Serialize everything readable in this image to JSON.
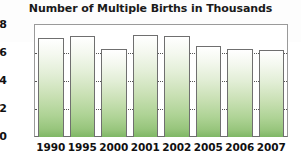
{
  "chart_data": {
    "type": "bar",
    "title": "Number of Multiple Births in Thousands",
    "xlabel": "",
    "ylabel": "",
    "categories": [
      "1990",
      "1995",
      "2000",
      "2001",
      "2002",
      "2005",
      "2006",
      "2007"
    ],
    "values": [
      3.0,
      4.8,
      7.1,
      7.3,
      7.2,
      6.5,
      6.3,
      6.2
    ],
    "ylim": [
      0,
      8
    ],
    "yticks": [
      0,
      2,
      4,
      6,
      8
    ],
    "ytick_labels": [
      "0",
      "2",
      "4",
      "6",
      "8"
    ],
    "gridlines": [
      2,
      4,
      6
    ],
    "grid": true,
    "legend": "none",
    "series": [
      {
        "name": "Multiple Births",
        "values": [
          3.0,
          4.8,
          7.1,
          7.3,
          7.2,
          6.5,
          6.3,
          6.2
        ]
      }
    ],
    "colors": {
      "bar_top": "#ffffff",
      "bar_bottom": "#7fb765",
      "bar_border": "#6f6f6f",
      "grid": "#555555",
      "axis": "#6d6d6d",
      "text": "#111111",
      "background": "#ffffff"
    }
  }
}
